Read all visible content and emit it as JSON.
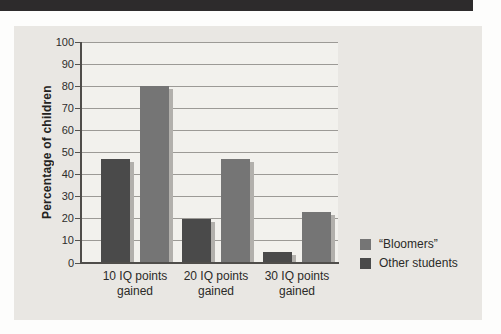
{
  "page": {
    "top_band_color": "#2d2b2c",
    "panel_bg": "#e9e7e3",
    "plot_bg": "#f2f1ed",
    "gridline_color": "#9c9a96",
    "axis_color": "#4f4d4a",
    "shadow_color": "#b2b0ac",
    "text_color": "#2b2a28"
  },
  "chart_data": {
    "type": "bar",
    "title": "",
    "xlabel": "",
    "ylabel": "Percentage of children",
    "ylim": [
      0,
      100
    ],
    "ytick_step": 10,
    "grid": true,
    "legend_position": "bottom-right",
    "categories": [
      "10 IQ points gained",
      "20 IQ points gained",
      "30 IQ points gained"
    ],
    "series": [
      {
        "name": "“Bloomers”",
        "values": [
          80,
          47,
          23
        ],
        "color": "#757575",
        "position": 1
      },
      {
        "name": "Other students",
        "values": [
          47,
          20,
          5
        ],
        "color": "#4a4a4a",
        "position": 0
      }
    ],
    "bar_has_drop_shadow": true
  }
}
